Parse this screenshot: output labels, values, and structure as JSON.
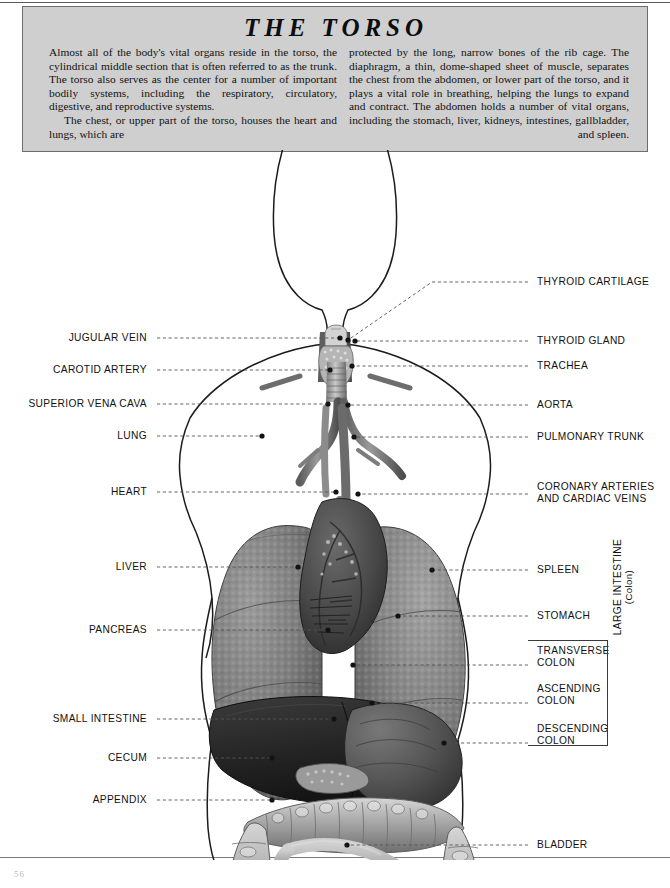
{
  "page": {
    "number": "56",
    "title": "THE TORSO"
  },
  "header": {
    "left_paragraphs": [
      "Almost all of the body's vital organs reside in the torso, the cylindrical middle section that is often referred to as the trunk. The torso also serves as the center for a number of important bodily systems, including the respiratory, circulatory, digestive, and reproductive systems.",
      "The chest, or upper part of the torso, houses the heart and lungs, which are"
    ],
    "right_paragraphs": [
      "protected by the long, narrow bones of the rib cage. The diaphragm, a thin, dome-shaped sheet of muscle, separates the chest from the abdomen, or lower part of the torso, and it plays a vital role in breathing, helping the lungs to expand and contract. The abdomen holds a number of vital organs, including the stomach, liver, kidneys, intestines, gallbladder, and spleen."
    ]
  },
  "figure": {
    "caption_group": {
      "label_line1": "LARGE INTESTINE",
      "label_line2": "(Colon)"
    },
    "left_labels": [
      {
        "name": "jugular-vein",
        "text": "JUGULAR VEIN",
        "y": 338,
        "leader_end_x": 340,
        "leader_end_y": 338
      },
      {
        "name": "carotid-artery",
        "text": "CAROTID ARTERY",
        "y": 370,
        "leader_end_x": 330,
        "leader_end_y": 370
      },
      {
        "name": "superior-vena-cava",
        "text": "SUPERIOR VENA CAVA",
        "y": 404,
        "leader_end_x": 328,
        "leader_end_y": 404
      },
      {
        "name": "lung",
        "text": "LUNG",
        "y": 436,
        "leader_end_x": 262,
        "leader_end_y": 436
      },
      {
        "name": "heart",
        "text": "HEART",
        "y": 492,
        "leader_end_x": 336,
        "leader_end_y": 492
      },
      {
        "name": "liver",
        "text": "LIVER",
        "y": 567,
        "leader_end_x": 298,
        "leader_end_y": 567
      },
      {
        "name": "pancreas",
        "text": "PANCREAS",
        "y": 630,
        "leader_end_x": 328,
        "leader_end_y": 630
      },
      {
        "name": "small-intestine",
        "text": "SMALL INTESTINE",
        "y": 719,
        "leader_end_x": 334,
        "leader_end_y": 719
      },
      {
        "name": "cecum",
        "text": "CECUM",
        "y": 758,
        "leader_end_x": 272,
        "leader_end_y": 758
      },
      {
        "name": "appendix",
        "text": "APPENDIX",
        "y": 800,
        "leader_end_x": 272,
        "leader_end_y": 800
      }
    ],
    "right_labels": [
      {
        "name": "thyroid-cartilage",
        "text": "THYROID CARTILAGE",
        "y": 282,
        "angled": true,
        "leader_end_x": 348,
        "leader_end_y": 340
      },
      {
        "name": "thyroid-gland",
        "text": "THYROID GLAND",
        "y": 341,
        "angled": false,
        "leader_end_x": 345,
        "leader_end_y": 341
      },
      {
        "name": "trachea",
        "text": "TRACHEA",
        "y": 366,
        "angled": false,
        "leader_end_x": 352,
        "leader_end_y": 366
      },
      {
        "name": "aorta",
        "text": "AORTA",
        "y": 405,
        "angled": false,
        "leader_end_x": 348,
        "leader_end_y": 405
      },
      {
        "name": "pulmonary-trunk",
        "text": "PULMONARY TRUNK",
        "y": 437,
        "angled": false,
        "leader_end_x": 354,
        "leader_end_y": 437
      },
      {
        "name": "coronary-arteries",
        "text": "CORONARY ARTERIES",
        "text2": "AND CARDIAC VEINS",
        "y": 487,
        "angled": false,
        "leader_end_x": 358,
        "leader_end_y": 494
      },
      {
        "name": "spleen",
        "text": "SPLEEN",
        "y": 570,
        "angled": false,
        "leader_end_x": 404,
        "leader_end_y": 570
      },
      {
        "name": "stomach",
        "text": "STOMACH",
        "y": 616,
        "angled": false,
        "leader_end_x": 398,
        "leader_end_y": 616
      },
      {
        "name": "transverse-colon",
        "text": "TRANSVERSE",
        "text2": "COLON",
        "y": 651,
        "angled": false,
        "leader_end_x": 353,
        "leader_end_y": 665
      },
      {
        "name": "ascending-colon",
        "text": "ASCENDING",
        "text2": "COLON",
        "y": 689,
        "angled": false,
        "leader_end_x": 372,
        "leader_end_y": 703
      },
      {
        "name": "descending-colon",
        "text": "DESCENDING",
        "text2": "COLON",
        "y": 729,
        "angled": false,
        "leader_end_x": 444,
        "leader_end_y": 743
      },
      {
        "name": "bladder",
        "text": "BLADDER",
        "y": 845,
        "angled": false,
        "leader_end_x": 347,
        "leader_end_y": 845
      }
    ]
  },
  "colors": {
    "header_bg": "#cfcfcf",
    "header_border": "#6d6d6d",
    "leader": "#555555",
    "text": "#111111",
    "organ_dark": "#2b2b2b",
    "organ_mid": "#6f6f6f",
    "organ_light": "#b8b8b8"
  }
}
